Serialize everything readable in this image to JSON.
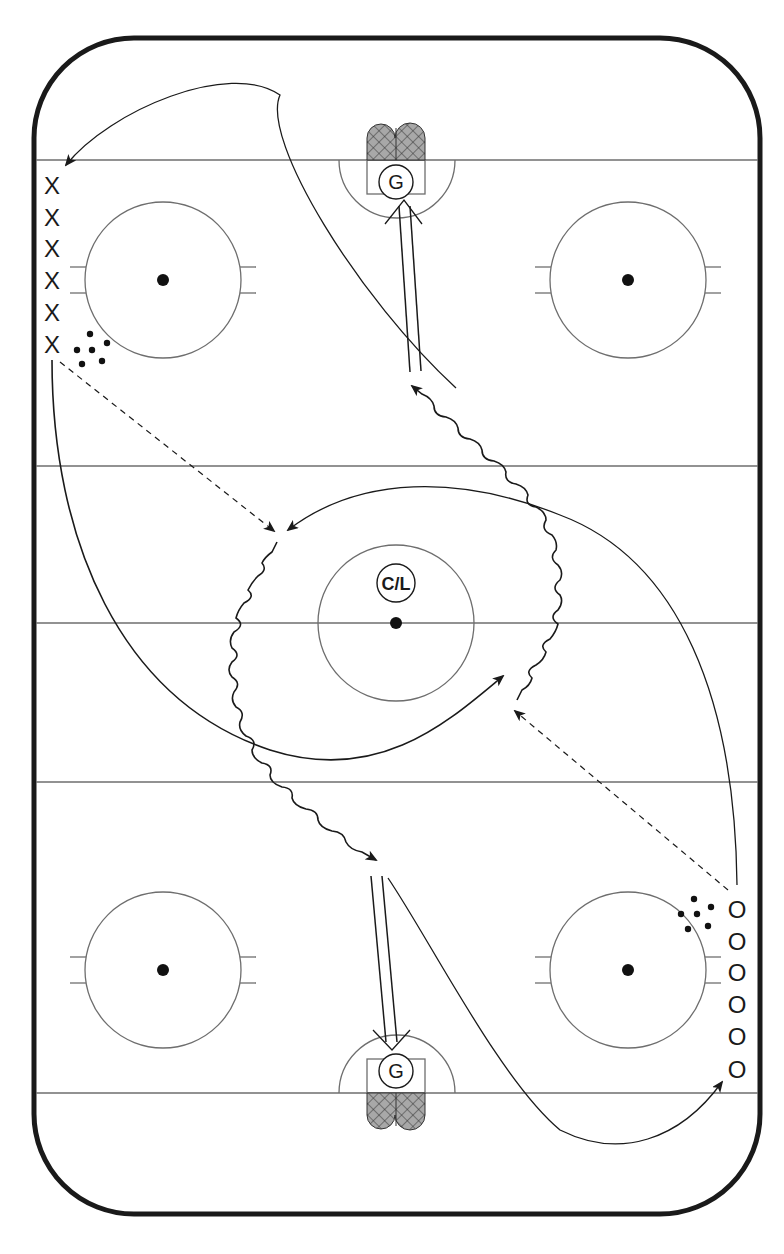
{
  "diagram": {
    "type": "ice-hockey-drill",
    "colors": {
      "board": "#1a1a1a",
      "line": "#6e6e6e",
      "path": "#1a1a1a",
      "net_fill": "#9a9a9a",
      "background": "#ffffff"
    },
    "rink": {
      "x": 32,
      "y": 36,
      "width": 730,
      "height": 1180,
      "corner_radius": 100,
      "goal_line_top_y": 160,
      "goal_line_bottom_y": 1093,
      "blue_line_top_y": 466,
      "blue_line_bottom_y": 782,
      "center_line_y": 623
    },
    "faceoff_circles": [
      {
        "name": "upper-left",
        "cx": 163,
        "cy": 280,
        "r": 78
      },
      {
        "name": "upper-right",
        "cx": 628,
        "cy": 280,
        "r": 78
      },
      {
        "name": "center",
        "cx": 396,
        "cy": 623,
        "r": 78
      },
      {
        "name": "lower-left",
        "cx": 163,
        "cy": 970,
        "r": 78
      },
      {
        "name": "lower-right",
        "cx": 628,
        "cy": 970,
        "r": 78
      }
    ],
    "goalies": [
      {
        "label": "G",
        "position": "top",
        "cx": 396,
        "cy": 182
      },
      {
        "label": "G",
        "position": "bottom",
        "cx": 396,
        "cy": 1071
      }
    ],
    "coach": {
      "label": "C/L",
      "cx": 396,
      "cy": 583
    },
    "team_x": {
      "symbol": "X",
      "count": 6,
      "x": 52,
      "ys": [
        185,
        217,
        248,
        280,
        312,
        344
      ]
    },
    "team_o": {
      "symbol": "O",
      "count": 6,
      "x": 737,
      "ys": [
        909,
        941,
        972,
        1004,
        1036,
        1069
      ]
    },
    "pucks_top": [
      [
        90,
        336
      ],
      [
        103,
        341
      ],
      [
        80,
        350
      ],
      [
        93,
        350
      ],
      [
        77,
        364
      ],
      [
        100,
        361
      ]
    ],
    "pucks_bottom": [
      [
        694,
        900
      ],
      [
        709,
        907
      ],
      [
        681,
        914
      ],
      [
        697,
        914
      ],
      [
        688,
        928
      ],
      [
        708,
        925
      ]
    ],
    "legend": {
      "solid_arrow": "skate",
      "wavy_arrow": "skate with puck",
      "dashed_arrow": "pass",
      "double_line_arrow": "shot"
    }
  }
}
